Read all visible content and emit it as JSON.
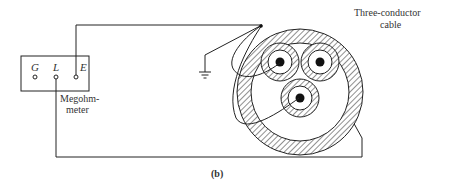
{
  "diagram": {
    "caption": "(b)",
    "meter": {
      "label_line1": "Megohm-",
      "label_line2": "meter",
      "terminals": [
        {
          "id": "G",
          "label": "G"
        },
        {
          "id": "L",
          "label": "L"
        },
        {
          "id": "E",
          "label": "E"
        }
      ]
    },
    "cable": {
      "label_line1": "Three-conductor",
      "label_line2": "cable",
      "conductor_count": 3
    },
    "ground": {
      "symbol": "ground-icon"
    },
    "colors": {
      "line": "#222222",
      "background": "#ffffff",
      "hatch": "#333333"
    }
  }
}
